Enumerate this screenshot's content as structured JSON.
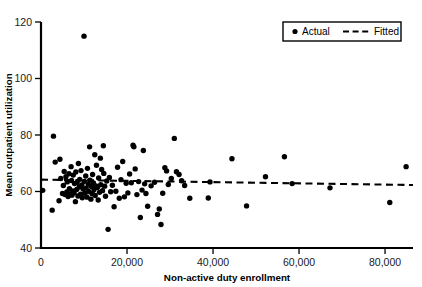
{
  "chart_data": {
    "type": "scatter",
    "title": "",
    "xlabel": "Non-active duty enrollment",
    "ylabel": "Mean outpatient utilization",
    "xlim": [
      0,
      86500
    ],
    "ylim": [
      40,
      120
    ],
    "xticks": [
      0,
      20000,
      40000,
      60000,
      80000
    ],
    "xticklabels": [
      "0",
      "20,000",
      "40,000",
      "60,000",
      "80,000"
    ],
    "yticks": [
      40,
      60,
      80,
      100,
      120
    ],
    "yticklabels": [
      "40",
      "60",
      "80",
      "100",
      "120"
    ],
    "grid": false,
    "legend_position": "top-right",
    "series": [
      {
        "name": "Actual",
        "type": "scatter",
        "marker": "circle",
        "color": "#000000",
        "points": [
          [
            400,
            60.4
          ],
          [
            2600,
            53.4
          ],
          [
            2900,
            79.6
          ],
          [
            3300,
            70.4
          ],
          [
            4200,
            56.7
          ],
          [
            4400,
            71.4
          ],
          [
            4600,
            64.6
          ],
          [
            5000,
            59.3
          ],
          [
            5200,
            62.1
          ],
          [
            5400,
            67.1
          ],
          [
            5600,
            58.9
          ],
          [
            5800,
            65.2
          ],
          [
            6000,
            59.8
          ],
          [
            6100,
            63.4
          ],
          [
            6300,
            58.2
          ],
          [
            6500,
            66.3
          ],
          [
            6600,
            61.0
          ],
          [
            6800,
            59.1
          ],
          [
            7000,
            68.8
          ],
          [
            7100,
            63.9
          ],
          [
            7200,
            58.7
          ],
          [
            7400,
            60.2
          ],
          [
            7500,
            65.8
          ],
          [
            7700,
            59.6
          ],
          [
            7800,
            62.8
          ],
          [
            8000,
            56.4
          ],
          [
            8100,
            66.9
          ],
          [
            8300,
            60.7
          ],
          [
            8400,
            63.2
          ],
          [
            8600,
            58.4
          ],
          [
            8700,
            69.9
          ],
          [
            8900,
            61.6
          ],
          [
            9000,
            64.3
          ],
          [
            9200,
            59.0
          ],
          [
            9300,
            67.4
          ],
          [
            9500,
            62.3
          ],
          [
            9600,
            57.8
          ],
          [
            9800,
            60.9
          ],
          [
            10000,
            115.0
          ],
          [
            10100,
            63.6
          ],
          [
            10200,
            59.4
          ],
          [
            10400,
            65.5
          ],
          [
            10500,
            61.2
          ],
          [
            10700,
            58.0
          ],
          [
            10800,
            68.2
          ],
          [
            11000,
            62.6
          ],
          [
            11100,
            60.0
          ],
          [
            11300,
            75.8
          ],
          [
            11400,
            64.0
          ],
          [
            11600,
            57.3
          ],
          [
            11700,
            61.8
          ],
          [
            11900,
            59.2
          ],
          [
            12000,
            66.0
          ],
          [
            12200,
            63.0
          ],
          [
            12300,
            60.6
          ],
          [
            12500,
            73.0
          ],
          [
            12600,
            58.6
          ],
          [
            12800,
            62.0
          ],
          [
            12900,
            69.3
          ],
          [
            13100,
            61.4
          ],
          [
            13300,
            57.0
          ],
          [
            13400,
            64.8
          ],
          [
            13600,
            59.7
          ],
          [
            13800,
            71.8
          ],
          [
            13900,
            62.4
          ],
          [
            14100,
            67.8
          ],
          [
            14300,
            60.3
          ],
          [
            14500,
            76.2
          ],
          [
            14600,
            66.4
          ],
          [
            14800,
            61.9
          ],
          [
            15000,
            58.3
          ],
          [
            15300,
            63.7
          ],
          [
            15600,
            46.6
          ],
          [
            15900,
            65.0
          ],
          [
            16200,
            59.9
          ],
          [
            16600,
            62.2
          ],
          [
            17000,
            54.6
          ],
          [
            17400,
            60.1
          ],
          [
            17800,
            68.6
          ],
          [
            18200,
            57.6
          ],
          [
            18600,
            64.2
          ],
          [
            19000,
            70.6
          ],
          [
            19400,
            58.1
          ],
          [
            19800,
            62.9
          ],
          [
            20200,
            59.5
          ],
          [
            20600,
            66.2
          ],
          [
            21000,
            63.1
          ],
          [
            21400,
            76.4
          ],
          [
            21600,
            75.8
          ],
          [
            21900,
            68.0
          ],
          [
            22300,
            58.9
          ],
          [
            22700,
            63.5
          ],
          [
            23100,
            50.8
          ],
          [
            23500,
            60.5
          ],
          [
            23800,
            74.5
          ],
          [
            24100,
            62.7
          ],
          [
            24400,
            59.3
          ],
          [
            24800,
            54.8
          ],
          [
            25600,
            62.0
          ],
          [
            26400,
            63.3
          ],
          [
            27100,
            51.9
          ],
          [
            27500,
            53.8
          ],
          [
            27900,
            48.3
          ],
          [
            28300,
            59.4
          ],
          [
            28800,
            68.4
          ],
          [
            29200,
            67.3
          ],
          [
            29600,
            62.5
          ],
          [
            30300,
            64.6
          ],
          [
            31000,
            78.8
          ],
          [
            31500,
            67.0
          ],
          [
            32100,
            66.0
          ],
          [
            32700,
            63.8
          ],
          [
            33400,
            62.1
          ],
          [
            34600,
            57.6
          ],
          [
            38900,
            57.7
          ],
          [
            39300,
            63.4
          ],
          [
            44400,
            71.6
          ],
          [
            47800,
            54.9
          ],
          [
            52200,
            65.2
          ],
          [
            56600,
            72.3
          ],
          [
            58400,
            62.8
          ],
          [
            67200,
            61.3
          ],
          [
            81100,
            56.1
          ],
          [
            84900,
            68.8
          ]
        ]
      },
      {
        "name": "Fitted",
        "type": "line",
        "style": "dashed",
        "color": "#000000",
        "endpoints": [
          [
            0,
            64.2
          ],
          [
            86500,
            62.3
          ]
        ]
      }
    ]
  },
  "legend": {
    "items": [
      {
        "label": "Actual",
        "marker": "dot-marker"
      },
      {
        "label": "Fitted",
        "marker": "dashed-line-marker"
      }
    ]
  }
}
